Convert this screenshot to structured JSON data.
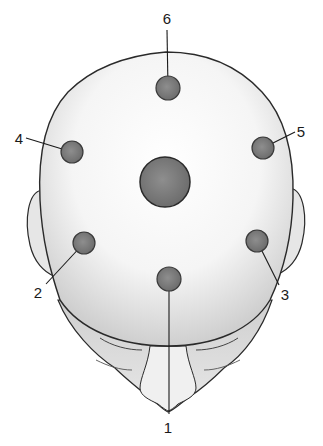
{
  "diagram": {
    "colors": {
      "background": "#ffffff",
      "skin": "#f4f4f4",
      "skin_shade": "#d2d2d2",
      "outline": "#2a2a2a",
      "point_fill": "#7a7a7a",
      "point_stroke": "#3a3a3a",
      "leader_line": "#1a1a1a"
    },
    "center_point": {
      "cx": 165,
      "cy": 182,
      "r": 25
    },
    "points": [
      {
        "label": "1",
        "cx": 169,
        "cy": 279,
        "r": 12,
        "label_x": 168,
        "label_y": 433,
        "line_to": [
          169,
          414
        ]
      },
      {
        "label": "2",
        "cx": 84,
        "cy": 243,
        "r": 11,
        "label_x": 38,
        "label_y": 298,
        "line_to": [
          46,
          284
        ]
      },
      {
        "label": "3",
        "cx": 257,
        "cy": 241,
        "r": 11,
        "label_x": 285,
        "label_y": 300,
        "line_to": [
          279,
          285
        ]
      },
      {
        "label": "4",
        "cx": 72,
        "cy": 152,
        "r": 11,
        "label_x": 19,
        "label_y": 144,
        "line_to": [
          26,
          138
        ]
      },
      {
        "label": "5",
        "cx": 263,
        "cy": 148,
        "r": 11,
        "label_x": 301,
        "label_y": 137,
        "line_to": [
          295,
          132
        ]
      },
      {
        "label": "6",
        "cx": 168,
        "cy": 88,
        "r": 12,
        "label_x": 167,
        "label_y": 24,
        "line_to": [
          167,
          30
        ]
      }
    ]
  }
}
